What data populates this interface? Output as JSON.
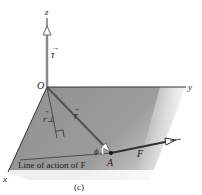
{
  "figure": {
    "caption": "(c)",
    "axes": {
      "x": "x",
      "y": "y",
      "z": "z",
      "origin": "O"
    },
    "vectors": {
      "torque": "τ",
      "position": "r",
      "perpendicular_arm": "r⊥",
      "force": "F"
    },
    "point": "A",
    "angle": "ϕ",
    "line_of_action_label": "Line of action of F",
    "colors": {
      "plane_fill": "#9a9a9a",
      "axis_line": "#333333",
      "torque_vector": "#8a8a8a",
      "vector_line": "#444444"
    }
  }
}
